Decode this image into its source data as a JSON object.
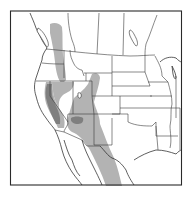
{
  "map": {
    "title": "",
    "region": "Western North America",
    "projection_frame": {
      "x": 10,
      "y": 11,
      "width": 172,
      "height": 174
    },
    "colors": {
      "background": "#ffffff",
      "range_primary": "#b3b3b3",
      "range_core": "#7f7f7f",
      "borders": "#3a3a3a"
    },
    "layers": [
      {
        "name": "range-primary",
        "description": "light gray distribution band"
      },
      {
        "name": "range-core",
        "description": "dark gray core areas"
      }
    ],
    "labels": []
  }
}
